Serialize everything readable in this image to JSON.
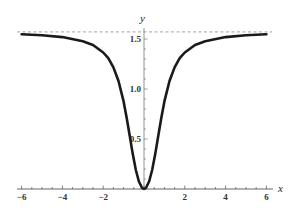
{
  "chart_data": {
    "type": "line",
    "title": "",
    "xlabel": "x",
    "ylabel": "y",
    "xlim": [
      -6,
      6
    ],
    "ylim": [
      0,
      1.5708
    ],
    "x_ticks": [
      -6,
      -4,
      -2,
      2,
      4,
      6
    ],
    "x_tick_labels": [
      "−6",
      "−4",
      "−2",
      "2",
      "4",
      "6"
    ],
    "y_ticks": [
      0.5,
      1.0,
      1.5
    ],
    "y_tick_labels": [
      "0.5",
      "1.0",
      "1.5"
    ],
    "x_minor_step": 0.5,
    "y_minor_step": 0.1,
    "grid": false,
    "asymptote": {
      "y": 1.5708,
      "style": "dashed",
      "label": ""
    },
    "series": [
      {
        "name": "y(x)",
        "color": "#1a1a1a",
        "x": [
          -6,
          -5,
          -4,
          -3,
          -2.5,
          -2,
          -1.75,
          -1.5,
          -1.25,
          -1,
          -0.85,
          -0.7,
          -0.55,
          -0.4,
          -0.25,
          -0.1,
          0,
          0.1,
          0.25,
          0.4,
          0.55,
          0.7,
          0.85,
          1,
          1.25,
          1.5,
          1.75,
          2,
          2.5,
          3,
          4,
          5,
          6
        ],
        "y": [
          1.548,
          1.537,
          1.519,
          1.478,
          1.44,
          1.365,
          1.308,
          1.216,
          1.08,
          0.876,
          0.713,
          0.532,
          0.349,
          0.19,
          0.075,
          0.012,
          0.0,
          0.012,
          0.075,
          0.19,
          0.349,
          0.532,
          0.713,
          0.876,
          1.08,
          1.216,
          1.308,
          1.365,
          1.44,
          1.478,
          1.519,
          1.537,
          1.548
        ]
      }
    ]
  },
  "labels": {
    "x_axis": "x",
    "y_axis": "y"
  }
}
